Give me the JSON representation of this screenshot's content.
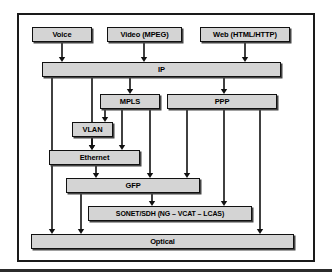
{
  "figure": {
    "style": {
      "box_fill": "#d4d4d4",
      "box_border": "#111111",
      "line_color": "#111111",
      "page_background": "#ffffff",
      "frame_border": "#1a1a1a"
    }
  },
  "nodes": [
    {
      "id": "voice",
      "label": "Voice",
      "x": 32,
      "y": 27,
      "w": 60,
      "h": 15,
      "font": 7.5
    },
    {
      "id": "video",
      "label": "Video (MPEG)",
      "x": 107,
      "y": 27,
      "w": 75,
      "h": 15,
      "font": 7.5
    },
    {
      "id": "web",
      "label": "Web (HTML/HTTP)",
      "x": 200,
      "y": 27,
      "w": 90,
      "h": 15,
      "font": 7.5
    },
    {
      "id": "ip",
      "label": "IP",
      "x": 42,
      "y": 62,
      "w": 239,
      "h": 15,
      "font": 7.5
    },
    {
      "id": "mpls",
      "label": "MPLS",
      "x": 100,
      "y": 94,
      "w": 60,
      "h": 15,
      "font": 7.5
    },
    {
      "id": "ppp",
      "label": "PPP",
      "x": 167,
      "y": 94,
      "w": 110,
      "h": 15,
      "font": 7.5
    },
    {
      "id": "vlan",
      "label": "VLAN",
      "x": 72,
      "y": 122,
      "w": 41,
      "h": 15,
      "font": 7.5
    },
    {
      "id": "ethernet",
      "label": "Ethernet",
      "x": 49,
      "y": 150,
      "w": 91,
      "h": 15,
      "font": 7.5
    },
    {
      "id": "gfp",
      "label": "GFP",
      "x": 66,
      "y": 178,
      "w": 134,
      "h": 15,
      "font": 7.5
    },
    {
      "id": "sonet",
      "label": "SONET/SDH (NG  – VCAT – LCAS)",
      "x": 88,
      "y": 206,
      "w": 164,
      "h": 15,
      "font": 7.0
    },
    {
      "id": "optical",
      "label": "Optical",
      "x": 31,
      "y": 234,
      "w": 263,
      "h": 15,
      "font": 7.5
    }
  ],
  "connections": [
    {
      "from": "voice",
      "to": "ip",
      "path": "M62,42 L62,60",
      "arrow": [
        62,
        62
      ]
    },
    {
      "from": "video",
      "to": "ip",
      "path": "M144,42 L144,60",
      "arrow": [
        144,
        62
      ]
    },
    {
      "from": "web",
      "to": "ip",
      "path": "M245,42 L245,60",
      "arrow": [
        245,
        62
      ]
    },
    {
      "from": "ip",
      "to": "optical",
      "path": "M52,77 L52,232",
      "arrow": [
        52,
        234
      ]
    },
    {
      "from": "ip",
      "to": "ethernet",
      "path": "M92,77 L92,148",
      "arrow": [
        92,
        150
      ]
    },
    {
      "from": "ip",
      "to": "mpls",
      "path": "M130,77 L130,92",
      "arrow": [
        130,
        94
      ]
    },
    {
      "from": "ip",
      "to": "ppp",
      "path": "M224,77 L224,92",
      "arrow": [
        224,
        94
      ]
    },
    {
      "from": "mpls",
      "to": "vlan",
      "path": "M105,109 L105,120",
      "arrow": [
        105,
        122
      ]
    },
    {
      "from": "mpls",
      "to": "ethernet",
      "path": "M122,109 L122,148",
      "arrow": [
        122,
        150
      ]
    },
    {
      "from": "mpls",
      "to": "gfp",
      "path": "M150,109 L150,176",
      "arrow": [
        150,
        178
      ]
    },
    {
      "from": "vlan",
      "to": "ethernet",
      "path": "M92,137 L92,148",
      "arrow": [
        92,
        150
      ]
    },
    {
      "from": "ethernet",
      "to": "gfp",
      "path": "M96,165 L96,176",
      "arrow": [
        96,
        178
      ]
    },
    {
      "from": "ppp",
      "to": "gfp",
      "path": "M187,109 L187,176",
      "arrow": [
        187,
        178
      ]
    },
    {
      "from": "ppp",
      "to": "sonet",
      "path": "M224,109 L224,204",
      "arrow": [
        224,
        206
      ]
    },
    {
      "from": "ppp",
      "to": "optical",
      "path": "M260,109 L260,232",
      "arrow": [
        260,
        234
      ]
    },
    {
      "from": "gfp",
      "to": "sonet",
      "path": "M152,193 L152,204",
      "arrow": [
        152,
        206
      ]
    },
    {
      "from": "gfp",
      "to": "optical",
      "path": "M81,193 L81,232",
      "arrow": [
        81,
        234
      ]
    }
  ]
}
